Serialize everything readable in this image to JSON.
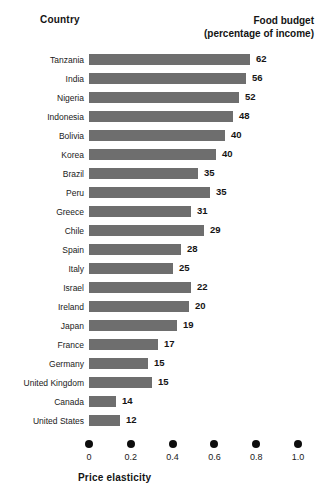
{
  "header": {
    "country_label": "Country",
    "budget_label_line1": "Food budget",
    "budget_label_line2": "(percentage of income)"
  },
  "axis": {
    "title": "Price elasticity",
    "ticks": [
      "0",
      "0.2",
      "0.4",
      "0.6",
      "0.8",
      "1.0"
    ]
  },
  "colors": {
    "bar": "#6e6e6e",
    "text": "#1a1a1a",
    "tick_dot": "#0d0d0d",
    "background": "#ffffff"
  },
  "chart_data": {
    "type": "bar",
    "orientation": "horizontal",
    "title": "",
    "xlabel": "Price elasticity",
    "ylabel": "Country",
    "xlim": [
      0,
      1.0
    ],
    "xticks": [
      0,
      0.2,
      0.4,
      0.6,
      0.8,
      1.0
    ],
    "grid": false,
    "legend": "none",
    "categories": [
      "Tanzania",
      "India",
      "Nigeria",
      "Indonesia",
      "Bolivia",
      "Korea",
      "Brazil",
      "Peru",
      "Greece",
      "Chile",
      "Spain",
      "Italy",
      "Israel",
      "Ireland",
      "Japan",
      "France",
      "Germany",
      "United Kingdom",
      "Canada",
      "United States"
    ],
    "series": [
      {
        "name": "Price elasticity",
        "values": [
          0.77,
          0.75,
          0.72,
          0.69,
          0.65,
          0.61,
          0.52,
          0.58,
          0.49,
          0.55,
          0.44,
          0.4,
          0.49,
          0.48,
          0.42,
          0.33,
          0.28,
          0.3,
          0.13,
          0.15
        ]
      },
      {
        "name": "Food budget (percentage of income)",
        "values": [
          62,
          56,
          52,
          48,
          40,
          40,
          35,
          35,
          31,
          29,
          28,
          25,
          22,
          20,
          19,
          17,
          15,
          15,
          14,
          12
        ]
      }
    ],
    "data_labels": {
      "source_series": "Food budget (percentage of income)",
      "position": "end-of-bar"
    }
  }
}
